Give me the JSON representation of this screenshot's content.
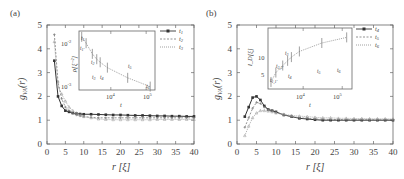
{
  "chart_data": [
    {
      "panel": "(a)",
      "type": "line",
      "xlabel": "r [ξ]",
      "ylabel": "g_VA(r)",
      "xlim": [
        0,
        40
      ],
      "ylim": [
        0,
        5
      ],
      "xticks": [
        0,
        5,
        10,
        15,
        20,
        25,
        30,
        35,
        40
      ],
      "yticks": [
        0,
        1,
        2,
        3,
        4,
        5
      ],
      "legend": [
        "t1",
        "t2",
        "t3"
      ],
      "legend_position": "upper right",
      "series": [
        {
          "name": "t1",
          "style": "solid-filled-square",
          "x": [
            2,
            3,
            4,
            5,
            6,
            7,
            8,
            9,
            10,
            12,
            14,
            16,
            18,
            20,
            22,
            24,
            26,
            28,
            30,
            32,
            34,
            36,
            38,
            40
          ],
          "y": [
            3.5,
            2.0,
            1.6,
            1.4,
            1.35,
            1.3,
            1.28,
            1.26,
            1.25,
            1.25,
            1.24,
            1.23,
            1.22,
            1.22,
            1.21,
            1.2,
            1.2,
            1.19,
            1.18,
            1.18,
            1.17,
            1.17,
            1.16,
            1.16
          ]
        },
        {
          "name": "t2",
          "style": "dashed-cross",
          "x": [
            2,
            3,
            4,
            5,
            6,
            7,
            8,
            9,
            10,
            12,
            14,
            16,
            18,
            20,
            22,
            24,
            26,
            28,
            30,
            32,
            34,
            36,
            38,
            40
          ],
          "y": [
            4.6,
            2.6,
            1.9,
            1.55,
            1.4,
            1.3,
            1.22,
            1.18,
            1.15,
            1.12,
            1.1,
            1.1,
            1.1,
            1.1,
            1.1,
            1.1,
            1.1,
            1.1,
            1.1,
            1.1,
            1.1,
            1.1,
            1.1,
            1.1
          ]
        },
        {
          "name": "t3",
          "style": "dotted-triangle",
          "x": [
            2,
            3,
            4,
            5,
            6,
            7,
            8,
            9,
            10,
            12,
            14,
            16,
            18,
            20,
            22,
            24,
            26,
            28,
            30,
            32,
            34,
            36,
            38,
            40
          ],
          "y": [
            4.3,
            2.4,
            2.1,
            1.8,
            1.55,
            1.4,
            1.3,
            1.22,
            1.15,
            1.1,
            1.05,
            1.03,
            1.02,
            1.02,
            1.02,
            1.02,
            1.02,
            1.02,
            1.03,
            1.03,
            1.03,
            1.03,
            1.03,
            1.03
          ]
        }
      ],
      "inset": {
        "type": "line",
        "xscale": "log",
        "yscale": "log",
        "xlabel": "t",
        "ylabel": "ρ[ξ⁻²]",
        "xticks": [
          "10^4",
          "10^5"
        ],
        "yticks": [
          "10^-2",
          "10^-3"
        ],
        "annotations": [
          "t1",
          "t1'",
          "t2",
          "t2'",
          "t3",
          "t4",
          "t5",
          "t6"
        ],
        "x": [
          1500,
          2000,
          3000,
          4000,
          5000,
          8000,
          30000,
          130000
        ],
        "y": [
          0.015,
          0.011,
          0.0065,
          0.005,
          0.0043,
          0.0033,
          0.002,
          0.0013
        ]
      }
    },
    {
      "panel": "(b)",
      "type": "line",
      "xlabel": "r [ξ]",
      "ylabel": "g_VA(r)",
      "xlim": [
        0,
        40
      ],
      "ylim": [
        0,
        5
      ],
      "xticks": [
        0,
        5,
        10,
        15,
        20,
        25,
        30,
        35,
        40
      ],
      "yticks": [
        0,
        1,
        2,
        3,
        4,
        5
      ],
      "legend": [
        "t4",
        "t5",
        "t6"
      ],
      "legend_position": "upper right",
      "series": [
        {
          "name": "t4",
          "style": "solid-filled-square",
          "x": [
            2,
            3,
            4,
            5,
            6,
            7,
            8,
            9,
            10,
            12,
            14,
            16,
            18,
            20,
            22,
            24,
            26,
            28,
            30,
            32,
            34,
            36,
            38,
            40
          ],
          "y": [
            1.15,
            1.55,
            1.95,
            2.0,
            1.85,
            1.6,
            1.45,
            1.4,
            1.35,
            1.22,
            1.15,
            1.08,
            1.05,
            1.02,
            1.0,
            1.0,
            1.0,
            1.0,
            1.0,
            1.0,
            1.0,
            1.0,
            1.0,
            1.0
          ]
        },
        {
          "name": "t5",
          "style": "dashed-cross",
          "x": [
            2,
            3,
            4,
            5,
            6,
            7,
            8,
            9,
            10,
            12,
            14,
            16,
            18,
            20,
            22,
            24,
            26,
            28,
            30,
            32,
            34,
            36,
            38,
            40
          ],
          "y": [
            0.7,
            1.1,
            1.5,
            1.75,
            1.7,
            1.55,
            1.45,
            1.38,
            1.32,
            1.22,
            1.15,
            1.1,
            1.08,
            1.05,
            1.04,
            1.03,
            1.03,
            1.02,
            1.02,
            1.02,
            1.02,
            1.02,
            1.02,
            1.02
          ]
        },
        {
          "name": "t6",
          "style": "dotted-triangle",
          "x": [
            2,
            3,
            4,
            5,
            6,
            7,
            8,
            9,
            10,
            12,
            14,
            16,
            18,
            20,
            22,
            24,
            26,
            28,
            30,
            32,
            34,
            36,
            38,
            40
          ],
          "y": [
            0.35,
            0.75,
            1.1,
            1.3,
            1.4,
            1.4,
            1.38,
            1.35,
            1.3,
            1.25,
            1.2,
            1.17,
            1.15,
            1.12,
            1.1,
            1.1,
            1.08,
            1.08,
            1.07,
            1.07,
            1.06,
            1.06,
            1.06,
            1.05
          ]
        }
      ],
      "inset": {
        "type": "line",
        "xscale": "log",
        "yscale": "linear",
        "xlabel": "t",
        "ylabel": "l_D[ξ]",
        "xticks": [
          "10^4",
          "10^5"
        ],
        "yticks": [
          "5",
          "10"
        ],
        "annotations": [
          "t1",
          "t1'",
          "t2",
          "t2'",
          "t3",
          "t4",
          "t5",
          "t6"
        ],
        "x": [
          1500,
          2000,
          3000,
          4000,
          5000,
          8000,
          30000,
          130000
        ],
        "y": [
          3.5,
          5.5,
          7.0,
          8.0,
          8.8,
          10.0,
          11.8,
          13.0
        ]
      }
    }
  ],
  "labels": {
    "panel_a": "(a)",
    "panel_b": "(b)",
    "xlabel": "r [ξ]",
    "ylabel_main": "g",
    "ylabel_sub": "VA",
    "ylabel_arg": "(r)",
    "inset_a_ylabel": "ρ[ξ⁻²]",
    "inset_b_ylabel": "l_D[ξ]",
    "inset_xlabel": "t",
    "legend_a": [
      "t",
      "t",
      "t"
    ],
    "legend_a_sub": [
      "1",
      "2",
      "3"
    ],
    "legend_b": [
      "t",
      "t",
      "t"
    ],
    "legend_b_sub": [
      "4",
      "5",
      "6"
    ]
  }
}
